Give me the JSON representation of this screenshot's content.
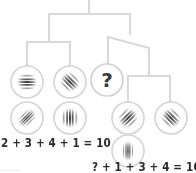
{
  "diagram": {
    "type": "tree",
    "colors": {
      "line": "#d9d9d9",
      "circle_border": "#d4d4d4",
      "question_border": "#cfcfcf",
      "grating": "#3a3a3a",
      "text": "#2a2a2a"
    },
    "nodes": [
      {
        "id": "n1",
        "kind": "grating",
        "orientation": "horizontal",
        "angle": 0,
        "cx": 27,
        "cy": 82
      },
      {
        "id": "n2",
        "kind": "grating",
        "orientation": "diagonal-down",
        "angle": 45,
        "cx": 70,
        "cy": 82
      },
      {
        "id": "n3",
        "kind": "question",
        "label": "?",
        "cx": 107,
        "cy": 80
      },
      {
        "id": "n4",
        "kind": "grating",
        "orientation": "diagonal-up",
        "angle": -45,
        "cx": 27,
        "cy": 118
      },
      {
        "id": "n5",
        "kind": "grating",
        "orientation": "vertical",
        "angle": 90,
        "cx": 70,
        "cy": 118
      },
      {
        "id": "n6",
        "kind": "grating",
        "orientation": "diagonal-up",
        "angle": -45,
        "cx": 128,
        "cy": 118
      },
      {
        "id": "n7",
        "kind": "grating",
        "orientation": "diagonal-down",
        "angle": 45,
        "cx": 171,
        "cy": 118
      },
      {
        "id": "n8",
        "kind": "grating",
        "orientation": "vertical",
        "angle": 90,
        "cx": 128,
        "cy": 151
      }
    ],
    "equations": [
      {
        "id": "eq1",
        "text": "2 + 3 + 4 + 1 = 10"
      },
      {
        "id": "eq2",
        "text": "? + 1 + 3 + 4 = 10"
      }
    ],
    "question_label": "?"
  }
}
